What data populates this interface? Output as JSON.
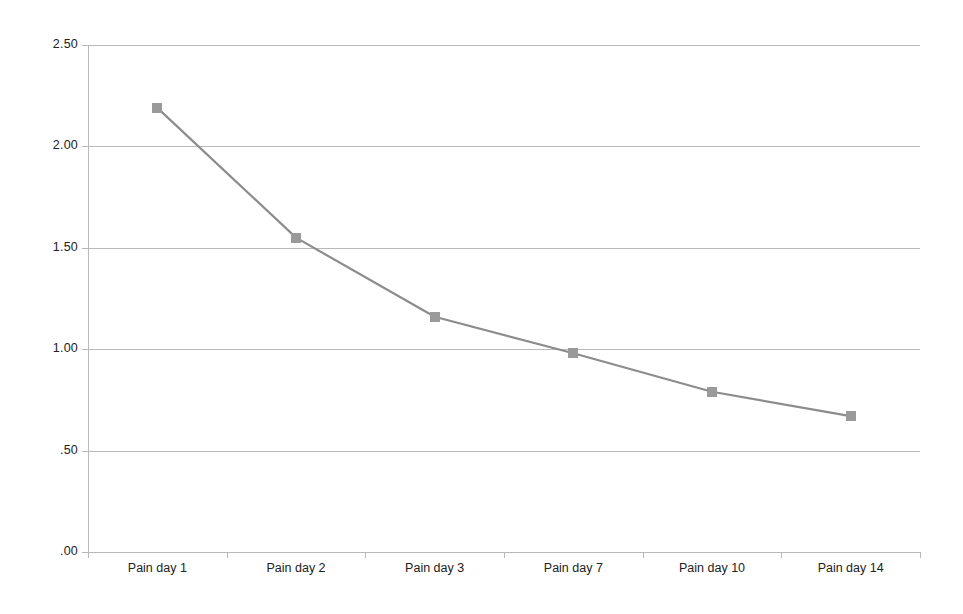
{
  "chart_data": {
    "type": "line",
    "title": "",
    "subtitle": "",
    "xlabel": "",
    "ylabel": "",
    "categories": [
      "Pain day 1",
      "Pain day 2",
      "Pain day 3",
      "Pain day 7",
      "Pain day 10",
      "Pain day 14"
    ],
    "series": [
      {
        "name": "Mean pain score",
        "values": [
          2.19,
          1.55,
          1.16,
          0.98,
          0.79,
          0.67
        ],
        "line_color": "#8c8c8c",
        "marker_color": "#9a9a9a",
        "marker_shape": "square"
      }
    ],
    "ylim": [
      0.0,
      2.5
    ],
    "ytick_values": [
      2.5,
      2.0,
      1.5,
      1.0,
      0.5,
      0.0
    ],
    "ytick_labels": [
      "2.50",
      "2.00",
      "1.50",
      "1.00",
      ".50",
      ".00"
    ],
    "grid": "horizontal",
    "grid_color": "#b9b9b9",
    "legend": "none",
    "background": "#ffffff",
    "annotations": []
  },
  "axes": {
    "y": {
      "ticks": [
        {
          "label": "2.50",
          "value": 2.5
        },
        {
          "label": "2.00",
          "value": 2.0
        },
        {
          "label": "1.50",
          "value": 1.5
        },
        {
          "label": "1.00",
          "value": 1.0
        },
        {
          "label": ".50",
          "value": 0.5
        },
        {
          "label": ".00",
          "value": 0.0
        }
      ]
    },
    "x": {
      "ticks": [
        {
          "label": "Pain day 1"
        },
        {
          "label": "Pain day 2"
        },
        {
          "label": "Pain day 3"
        },
        {
          "label": "Pain day 7"
        },
        {
          "label": "Pain day 10"
        },
        {
          "label": "Pain day 14"
        }
      ]
    }
  }
}
